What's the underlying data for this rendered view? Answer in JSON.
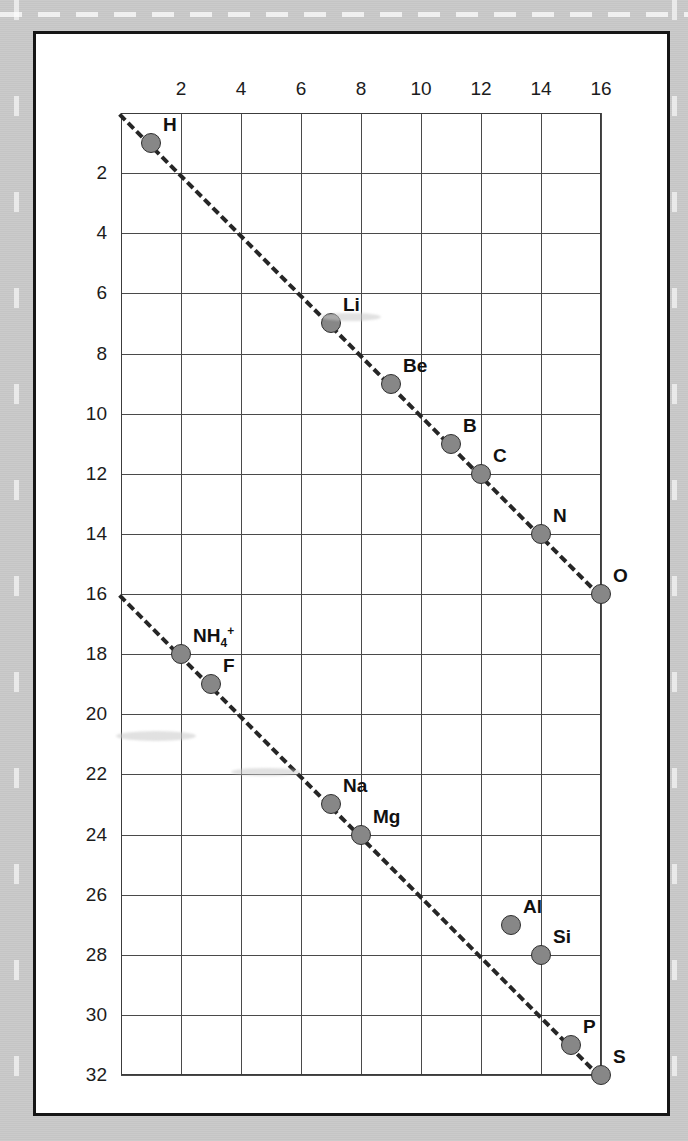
{
  "figure": {
    "type": "scatter",
    "background_color": "#c9c9c9",
    "card_color": "#ffffff",
    "point_color": "#878787",
    "line_color": "#262626"
  },
  "chart_data": {
    "type": "scatter",
    "title": "",
    "xlabel": "",
    "ylabel": "",
    "xlim": [
      0,
      16
    ],
    "ylim": [
      0,
      32
    ],
    "y_axis_inverted": true,
    "grid": true,
    "legend": "none",
    "x_ticks": [
      2,
      4,
      6,
      8,
      10,
      12,
      14,
      16
    ],
    "y_ticks": [
      2,
      4,
      6,
      8,
      10,
      12,
      14,
      16,
      18,
      20,
      22,
      24,
      26,
      28,
      30,
      32
    ],
    "x_tick_labels": [
      "2",
      "4",
      "6",
      "8",
      "10",
      "12",
      "14",
      "16"
    ],
    "y_tick_labels": [
      "2",
      "4",
      "6",
      "8",
      "10",
      "12",
      "14",
      "16",
      "18",
      "20",
      "22",
      "24",
      "26",
      "28",
      "30",
      "32"
    ],
    "points": [
      {
        "label": "H",
        "html": "H",
        "x": 1,
        "y": 1
      },
      {
        "label": "Li",
        "html": "Li",
        "x": 7,
        "y": 7
      },
      {
        "label": "Be",
        "html": "Be",
        "x": 9,
        "y": 9
      },
      {
        "label": "B",
        "html": "B",
        "x": 11,
        "y": 11
      },
      {
        "label": "C",
        "html": "C",
        "x": 12,
        "y": 12
      },
      {
        "label": "N",
        "html": "N",
        "x": 14,
        "y": 14
      },
      {
        "label": "O",
        "html": "O",
        "x": 16,
        "y": 16
      },
      {
        "label": "NH4+",
        "html": "NH<sub>4</sub><sup>+</sup>",
        "x": 2,
        "y": 18
      },
      {
        "label": "F",
        "html": "F",
        "x": 3,
        "y": 19
      },
      {
        "label": "Na",
        "html": "Na",
        "x": 7,
        "y": 23
      },
      {
        "label": "Mg",
        "html": "Mg",
        "x": 8,
        "y": 24
      },
      {
        "label": "Al",
        "html": "Al",
        "x": 13,
        "y": 27
      },
      {
        "label": "Si",
        "html": "Si",
        "x": 14,
        "y": 28
      },
      {
        "label": "P",
        "html": "P",
        "x": 15,
        "y": 31
      },
      {
        "label": "S",
        "html": "S",
        "x": 16,
        "y": 32
      }
    ],
    "trendlines": [
      {
        "name": "series-1-trendline",
        "x0": 0,
        "y0": 0,
        "x1": 16,
        "y1": 16
      },
      {
        "name": "series-2-trendline",
        "x0": 0,
        "y0": 16,
        "x1": 16,
        "y1": 32
      }
    ]
  }
}
